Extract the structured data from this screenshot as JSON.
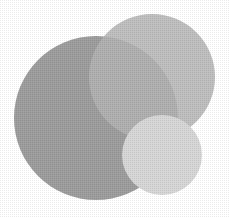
{
  "illustration": {
    "description": "Three overlapping gray circles with halftone texture",
    "background": "#ffffff",
    "circles": [
      {
        "name": "large-dark-circle",
        "cx": 96,
        "cy": 118,
        "r": 82,
        "fill": "#9c9c9c"
      },
      {
        "name": "medium-circle",
        "cx": 152,
        "cy": 77,
        "r": 63,
        "fill": "#b3b3b3"
      },
      {
        "name": "small-light-circle",
        "cx": 162,
        "cy": 155,
        "r": 40,
        "fill": "#d6d6d6"
      }
    ]
  }
}
